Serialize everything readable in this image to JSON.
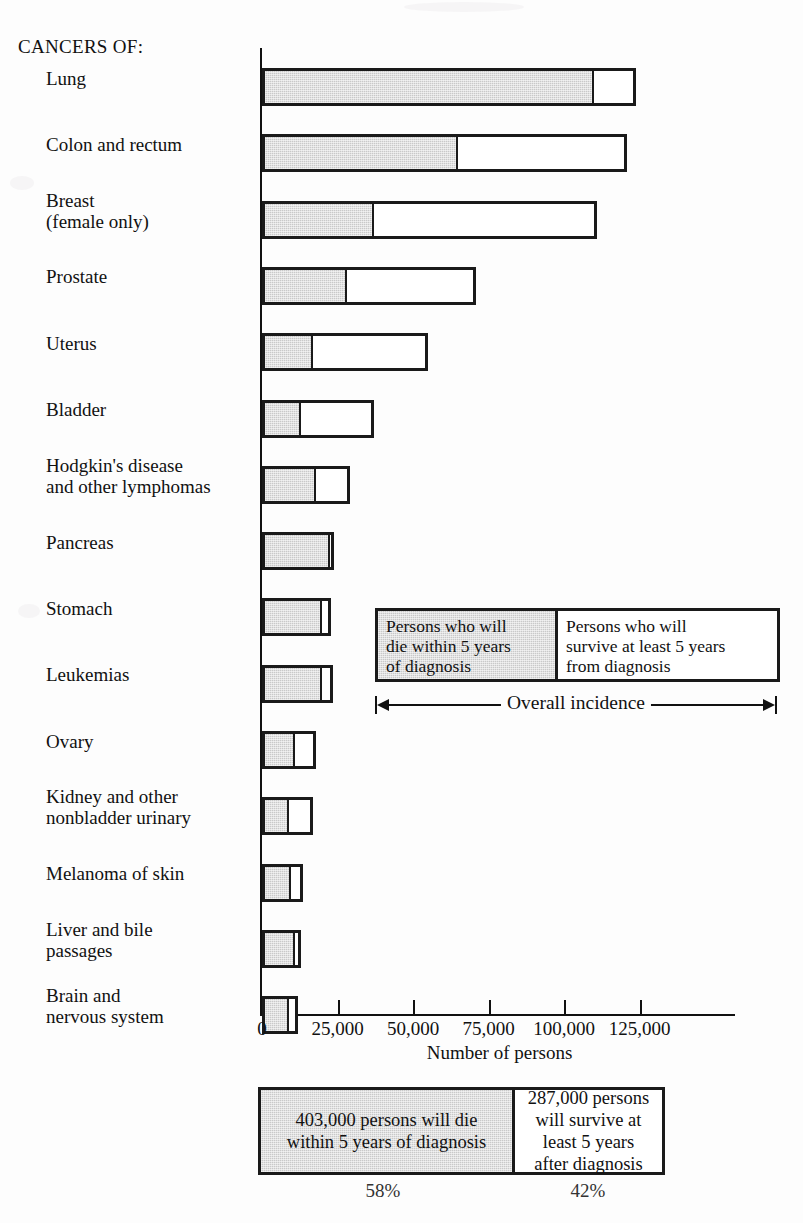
{
  "header": {
    "group_label": "CANCERS OF:"
  },
  "axis": {
    "xlabel": "Number of persons",
    "ticks": [
      "0",
      "25,000",
      "50,000",
      "75,000",
      "100,000",
      "125,000"
    ],
    "tick_values": [
      0,
      25000,
      50000,
      75000,
      100000,
      125000
    ]
  },
  "legend": {
    "die_label": "Persons who will\ndie within 5 years\nof diagnosis",
    "survive_label": "Persons who will\nsurvive at least 5 years\nfrom diagnosis",
    "incidence_label": "Overall incidence"
  },
  "summary": {
    "die_text": "403,000 persons will die\nwithin 5 years of diagnosis",
    "survive_text": "287,000 persons\nwill survive at\nleast 5 years\nafter diagnosis",
    "die_percent": "58%",
    "survive_percent": "42%"
  },
  "colors": {
    "die_fill": "#c9c9c9",
    "survive_fill": "#ffffff",
    "outline": "#1a1a1a",
    "background": "#fdfdfd"
  },
  "chart_data": {
    "type": "bar",
    "orientation": "horizontal",
    "stacked": true,
    "title": "",
    "xlabel": "Number of persons",
    "ylabel": "",
    "xlim": [
      0,
      155000
    ],
    "grid": false,
    "legend_position": "inside-right",
    "categories": [
      "Lung",
      "Colon and rectum",
      "Breast\n(female only)",
      "Prostate",
      "Uterus",
      "Bladder",
      "Hodgkin's disease\nand other lymphomas",
      "Pancreas",
      "Stomach",
      "Leukemias",
      "Ovary",
      "Kidney and other\nnonbladder urinary",
      "Melanoma of skin",
      "Liver and bile\npassages",
      "Brain and\nnervous system"
    ],
    "series": [
      {
        "name": "Persons who will die within 5 years of diagnosis",
        "values": [
          110000,
          65000,
          37000,
          28000,
          17000,
          13000,
          18000,
          22500,
          20000,
          20000,
          11000,
          9000,
          9500,
          11000,
          9000
        ]
      },
      {
        "name": "Persons who will survive at least 5 years from diagnosis",
        "values": [
          14000,
          56000,
          74000,
          43000,
          38000,
          24000,
          11000,
          1500,
          3000,
          3500,
          7000,
          8000,
          4000,
          2000,
          3000
        ]
      }
    ],
    "totals": [
      124000,
      121000,
      111000,
      71000,
      55000,
      37000,
      29000,
      24000,
      23000,
      23500,
      18000,
      17000,
      13500,
      13000,
      12000
    ],
    "overall_die_total": 403000,
    "overall_survive_total": 287000,
    "overall_die_percent": 58,
    "overall_survive_percent": 42
  }
}
